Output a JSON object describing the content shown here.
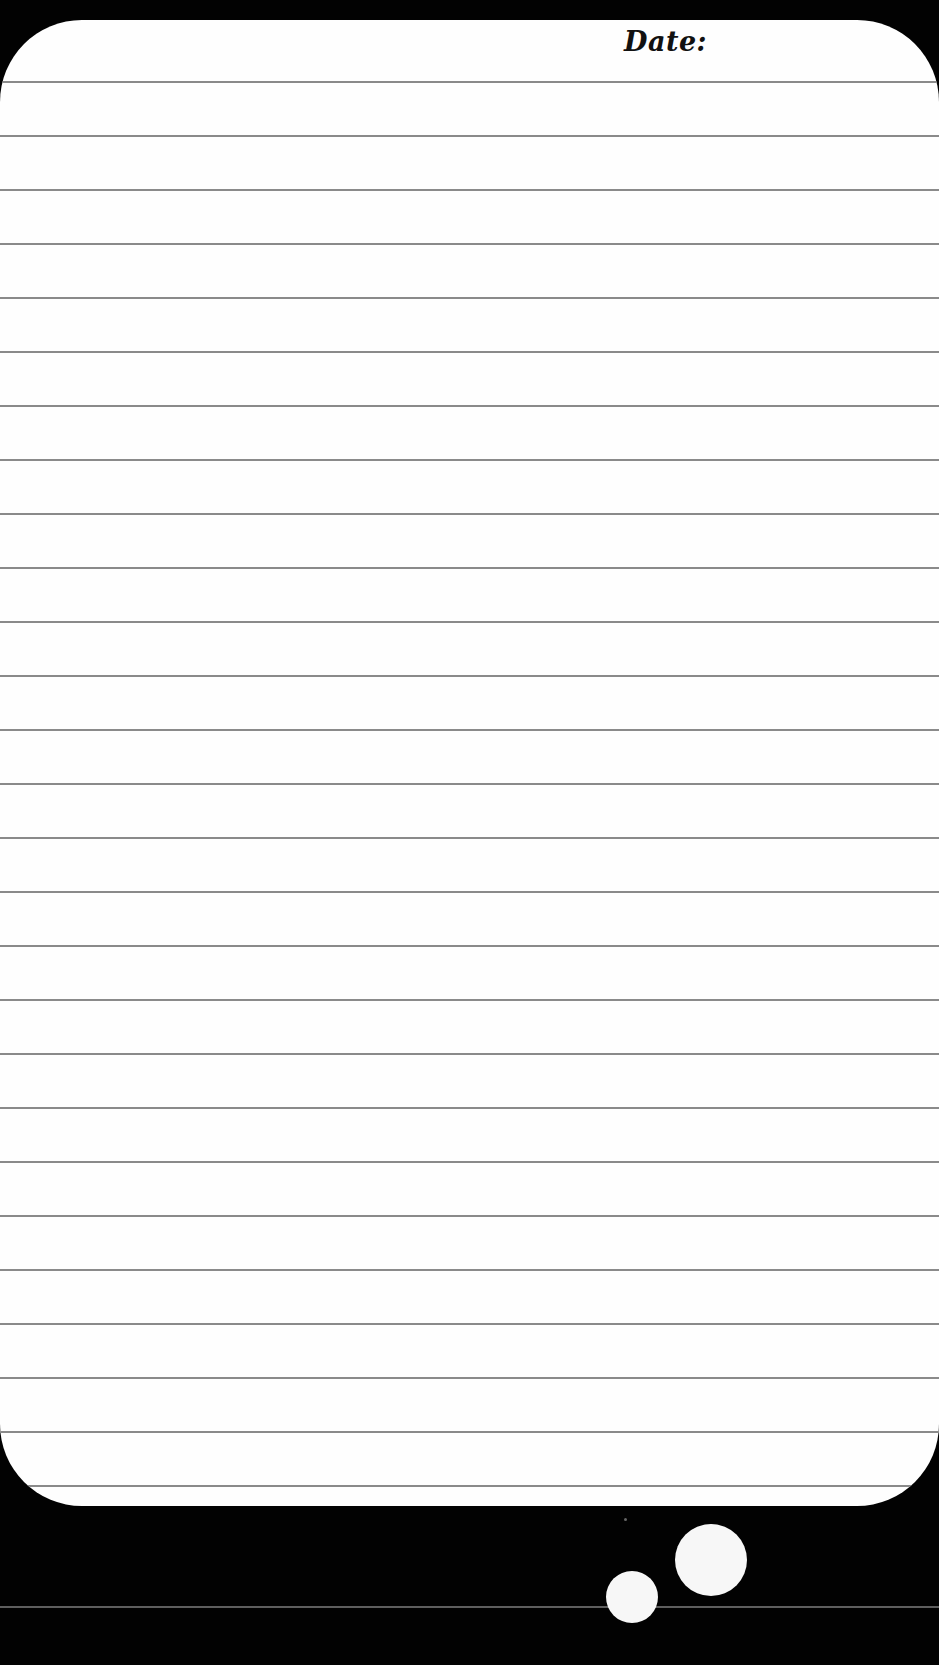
{
  "note": {
    "date_label": "Date:",
    "ruled_line_count": 27,
    "first_line_y": 61,
    "line_spacing": 54,
    "line_color": "#8a8a8a",
    "paper_color": "#fefefe",
    "background_color": "#020202"
  },
  "decoration": {
    "bubbles": [
      {
        "name": "small-bubble",
        "cx": 632,
        "cy": 1597,
        "r": 26
      },
      {
        "name": "large-bubble",
        "cx": 711,
        "cy": 1560,
        "r": 36
      }
    ]
  }
}
